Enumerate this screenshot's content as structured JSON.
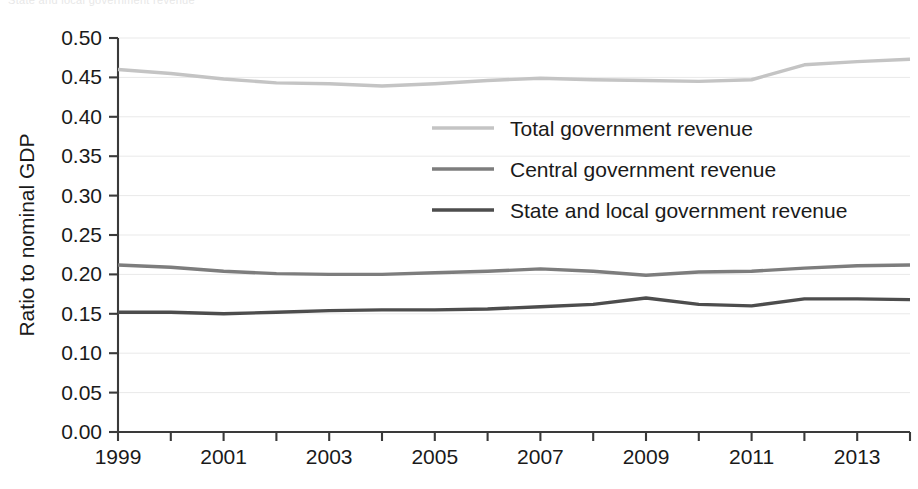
{
  "figure": {
    "caption_fragment": "State and local government revenue"
  },
  "chart_data": {
    "type": "line",
    "title": "",
    "subtitle": "",
    "xlabel": "",
    "ylabel": "Ratio to nominal GDP",
    "xlim": [
      1999,
      2014
    ],
    "ylim": [
      0.0,
      0.5
    ],
    "ytick_step": 0.05,
    "grid": true,
    "grid_axis": "y",
    "legend_position": "center",
    "x": [
      1999,
      2000,
      2001,
      2002,
      2003,
      2004,
      2005,
      2006,
      2007,
      2008,
      2009,
      2010,
      2011,
      2012,
      2013,
      2014
    ],
    "xtick_labels": [
      "1999",
      "",
      "2001",
      "",
      "2003",
      "",
      "2005",
      "",
      "2007",
      "",
      "2009",
      "",
      "2011",
      "",
      "2013",
      ""
    ],
    "xticks_labeled": [
      "1999",
      "2001",
      "2003",
      "2005",
      "2007",
      "2009",
      "2011",
      "2013"
    ],
    "ytick_labels": [
      "0.00",
      "0.05",
      "0.10",
      "0.15",
      "0.20",
      "0.25",
      "0.30",
      "0.35",
      "0.40",
      "0.45",
      "0.50"
    ],
    "ytick_values": [
      0.0,
      0.05,
      0.1,
      0.15,
      0.2,
      0.25,
      0.3,
      0.35,
      0.4,
      0.45,
      0.5
    ],
    "series": [
      {
        "name": "Total government revenue",
        "color": "#c4c4c4",
        "width": 3.4,
        "values": [
          0.46,
          0.455,
          0.448,
          0.443,
          0.442,
          0.439,
          0.442,
          0.446,
          0.449,
          0.447,
          0.446,
          0.445,
          0.447,
          0.466,
          0.47,
          0.473
        ]
      },
      {
        "name": "Central government revenue",
        "color": "#7d7d7d",
        "width": 3.4,
        "values": [
          0.212,
          0.209,
          0.204,
          0.201,
          0.2,
          0.2,
          0.202,
          0.204,
          0.207,
          0.204,
          0.199,
          0.203,
          0.204,
          0.208,
          0.211,
          0.212
        ]
      },
      {
        "name": "State and local government revenue",
        "color": "#4d4d4d",
        "width": 3.4,
        "values": [
          0.152,
          0.152,
          0.15,
          0.152,
          0.154,
          0.155,
          0.155,
          0.156,
          0.159,
          0.162,
          0.17,
          0.162,
          0.16,
          0.169,
          0.169,
          0.168
        ]
      }
    ]
  },
  "legend": {
    "items": [
      {
        "label": "Total government revenue",
        "color": "#c4c4c4"
      },
      {
        "label": "Central government revenue",
        "color": "#7d7d7d"
      },
      {
        "label": "State and local government revenue",
        "color": "#4d4d4d"
      }
    ]
  }
}
